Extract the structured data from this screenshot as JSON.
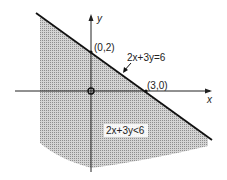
{
  "diagram": {
    "axis_x_label": "x",
    "axis_y_label": "y",
    "boundary_line_label": "2x+3y=6",
    "region_label": "2x+3y<6",
    "intercepts": [
      {
        "label": "(0,2)",
        "x": 0,
        "y": 2
      },
      {
        "label": "(3,0)",
        "x": 3,
        "y": 0
      }
    ],
    "origin": {
      "x": 0,
      "y": 0
    },
    "colors": {
      "line": "#111111",
      "shade": "#b8b8b8",
      "axis": "#222222"
    }
  }
}
